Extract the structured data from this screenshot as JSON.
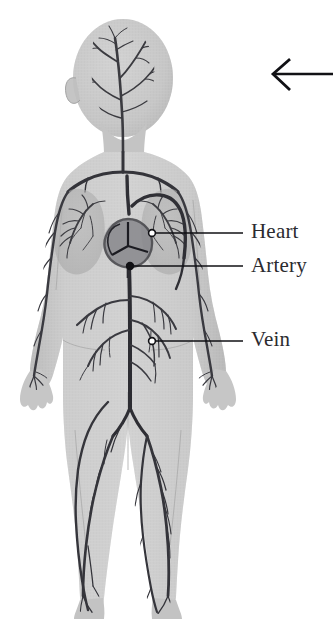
{
  "figure": {
    "background_color": "#ffffff",
    "body_fill_color": "#c9c9c9",
    "body_shade_color": "#b3b3b3",
    "vessel_color": "#3a3a3e",
    "label_color": "#2b2b2f",
    "leader_color": "#1c1c20"
  },
  "labels": [
    {
      "id": "heart",
      "text": "Heart",
      "marker": "open-circle",
      "marker_x": 152,
      "marker_y": 233,
      "leader_to_x": 243,
      "leader_to_y": 233
    },
    {
      "id": "artery",
      "text": "Artery",
      "marker": "filled-circle",
      "marker_x": 130,
      "marker_y": 266,
      "leader_to_x": 243,
      "leader_to_y": 266
    },
    {
      "id": "vein",
      "text": "Vein",
      "marker": "open-circle",
      "marker_x": 152,
      "marker_y": 341,
      "leader_to_x": 243,
      "leader_to_y": 341
    }
  ],
  "pointer_arrow": {
    "name": "left-arrow",
    "direction": "left",
    "tip_x": 272,
    "tip_y": 74,
    "tail_x": 333,
    "tail_y": 74,
    "color": "#111115"
  },
  "anatomy_parts": [
    "head-vessels",
    "neck-vessels",
    "lung-left",
    "lung-right",
    "heart",
    "aorta",
    "arm-vessels-left",
    "arm-vessels-right",
    "abdominal-vessels",
    "leg-vessels-left",
    "leg-vessels-right"
  ]
}
